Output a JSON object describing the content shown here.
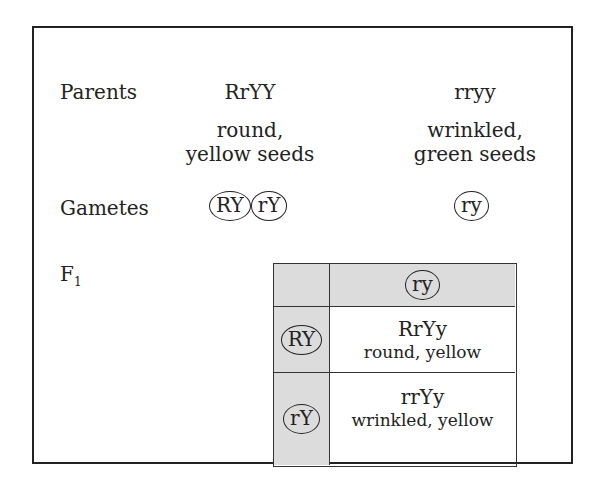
{
  "labels": {
    "parents": "Parents",
    "gametes": "Gametes",
    "f1_main": "F",
    "f1_sub": "1"
  },
  "parents": [
    {
      "genotype": "RrYY",
      "phenotype_line1": "round,",
      "phenotype_line2": "yellow seeds"
    },
    {
      "genotype": "rryy",
      "phenotype_line1": "wrinkled,",
      "phenotype_line2": "green seeds"
    }
  ],
  "gametes": {
    "parent1": [
      "RY",
      "rY"
    ],
    "parent2": [
      "ry"
    ]
  },
  "punnett": {
    "column_header": "ry",
    "rows": [
      {
        "gamete": "RY",
        "genotype": "RrYy",
        "phenotype": "round, yellow"
      },
      {
        "gamete": "rY",
        "genotype": "rrYy",
        "phenotype": "wrinkled, yellow"
      }
    ]
  },
  "colors": {
    "border": "#222222",
    "header_fill": "#dcdcdc",
    "background": "#ffffff"
  }
}
